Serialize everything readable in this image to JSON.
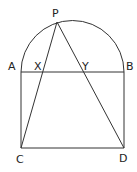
{
  "diagram": {
    "type": "geometry",
    "stroke_color": "#333333",
    "points": {
      "A": {
        "label": "A",
        "x": 21,
        "y": 72
      },
      "B": {
        "label": "B",
        "x": 124,
        "y": 72
      },
      "C": {
        "label": "C",
        "x": 21,
        "y": 148
      },
      "D": {
        "label": "D",
        "x": 124,
        "y": 148
      },
      "P": {
        "label": "P",
        "x": 57,
        "y": 22
      },
      "X": {
        "label": "X"
      },
      "Y": {
        "label": "Y"
      }
    }
  }
}
